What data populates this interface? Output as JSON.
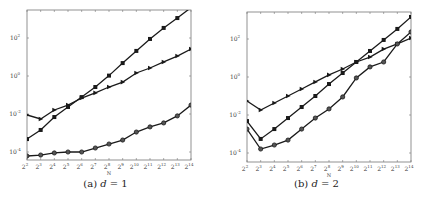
{
  "chart_data": [
    {
      "type": "line",
      "title": "",
      "caption": "(a) d = 1",
      "xlabel": "N",
      "ylabel": "",
      "xscale": "log2",
      "yscale": "log10",
      "x_tick_labels": [
        "2^2",
        "2^3",
        "2^4",
        "2^5",
        "2^6",
        "2^7",
        "2^8",
        "2^9",
        "2^10",
        "2^11",
        "2^12",
        "2^13",
        "2^14"
      ],
      "y_tick_labels": [
        "10^-4",
        "10^-2",
        "10^0",
        "10^2"
      ],
      "x_exponents": [
        2,
        3,
        4,
        5,
        6,
        7,
        8,
        9,
        10,
        11,
        12,
        13,
        14
      ],
      "ylim_log10": [
        -4.4,
        3.5
      ],
      "grid": false,
      "legend": null,
      "series": [
        {
          "name": "square-markers",
          "marker": "square",
          "log10_values": [
            -3.32,
            -2.84,
            -2.16,
            -1.63,
            -1.11,
            -0.58,
            0.02,
            0.68,
            1.32,
            1.95,
            2.53,
            3.05,
            3.6
          ]
        },
        {
          "name": "triangle-markers",
          "marker": "triangle",
          "log10_values": [
            -2.05,
            -2.26,
            -1.79,
            -1.53,
            -1.16,
            -0.89,
            -0.58,
            -0.32,
            0.16,
            0.42,
            0.74,
            1.05,
            1.42
          ]
        },
        {
          "name": "circle-markers",
          "marker": "circle",
          "log10_values": [
            -4.21,
            -4.16,
            -4.05,
            -4.0,
            -4.0,
            -3.79,
            -3.58,
            -3.37,
            -2.95,
            -2.68,
            -2.47,
            -2.1,
            -1.53
          ]
        }
      ]
    },
    {
      "type": "line",
      "title": "",
      "caption": "(b) d = 2",
      "xlabel": "N",
      "ylabel": "",
      "xscale": "log2",
      "yscale": "log10",
      "x_tick_labels": [
        "2^2",
        "2^3",
        "2^4",
        "2^5",
        "2^6",
        "2^7",
        "2^8",
        "2^9",
        "2^10",
        "2^11",
        "2^12",
        "2^13",
        "2^14"
      ],
      "y_tick_labels": [
        "10^-4",
        "10^-2",
        "10^0",
        "10^2"
      ],
      "x_exponents": [
        2,
        3,
        4,
        5,
        6,
        7,
        8,
        9,
        10,
        11,
        12,
        13,
        14
      ],
      "ylim_log10": [
        -4.4,
        3.4
      ],
      "grid": false,
      "legend": null,
      "series": [
        {
          "name": "square-markers",
          "marker": "square",
          "log10_values": [
            -2.32,
            -3.26,
            -2.74,
            -2.16,
            -1.58,
            -1.0,
            -0.37,
            0.21,
            0.79,
            1.37,
            1.95,
            2.53,
            3.16
          ]
        },
        {
          "name": "triangle-markers",
          "marker": "triangle",
          "log10_values": [
            -1.26,
            -1.74,
            -1.37,
            -1.0,
            -0.63,
            -0.26,
            0.11,
            0.42,
            0.79,
            1.05,
            1.47,
            1.74,
            2.05
          ]
        },
        {
          "name": "circle-markers",
          "marker": "circle",
          "log10_values": [
            -2.74,
            -3.79,
            -3.58,
            -3.32,
            -2.74,
            -2.16,
            -1.68,
            -1.05,
            -0.05,
            0.53,
            0.79,
            1.74,
            2.37
          ]
        }
      ]
    }
  ],
  "captions": {
    "a_prefix": "(a) ",
    "a_var": "d",
    "a_rest": " = 1",
    "b_prefix": "(b) ",
    "b_var": "d",
    "b_rest": " = 2"
  },
  "colors": {
    "line": "#1a1a1a",
    "axis": "#777777",
    "tick_label": "#444444"
  }
}
